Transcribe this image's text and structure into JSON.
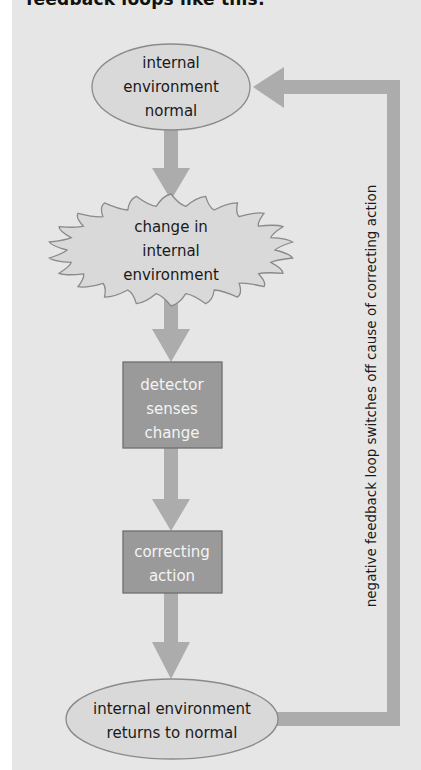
{
  "intro_text": "feedback loops like this:",
  "colors": {
    "background": "#e6e6e6",
    "arrow": "#acacac",
    "ellipse_fill": "#d9d9d9",
    "ellipse_stroke": "#8a8a8a",
    "box_fill": "#9a9a9a",
    "box_stroke": "#6f6f6f",
    "box_text": "#f4f4f4",
    "text": "#1a1a1a"
  },
  "nodes": {
    "normal": {
      "shape": "ellipse",
      "lines": [
        "internal",
        "environment",
        "normal"
      ]
    },
    "change": {
      "shape": "starburst",
      "lines": [
        "change in",
        "internal",
        "environment"
      ]
    },
    "detector": {
      "shape": "box",
      "lines": [
        "detector",
        "senses",
        "change"
      ]
    },
    "correcting": {
      "shape": "box",
      "lines": [
        "correcting",
        "action"
      ]
    },
    "returns": {
      "shape": "ellipse",
      "lines": [
        "internal environment",
        "returns to normal"
      ]
    }
  },
  "feedback_label": "negative feedback loop switches off cause of correcting action",
  "flow": [
    "normal",
    "change",
    "detector",
    "correcting",
    "returns",
    "normal"
  ]
}
